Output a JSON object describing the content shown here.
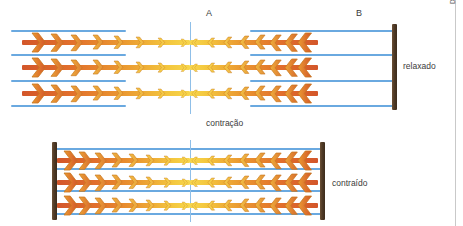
{
  "canvas": {
    "width": 463,
    "height": 226,
    "background": "#ffffff"
  },
  "credit": {
    "text": "Davidson França",
    "color": "#555555"
  },
  "labels": {
    "band_a": "A",
    "band_b": "B",
    "state_relaxed": "relaxado",
    "transition": "contração",
    "state_contracted": "contraído"
  },
  "colors": {
    "actin_blue": "#6aa9e0",
    "mline_blue": "#8fbfe8",
    "zdisc_brown": "#4f3a26",
    "myosin_orange": "#d3562a",
    "myosin_mid": "#eb9b31",
    "myosin_yellow": "#f7d64c",
    "edge_rule": "#c9c9c9",
    "text": "#3b3b3b"
  },
  "diagram": {
    "type": "sarcomere-sliding-filament",
    "panels": [
      {
        "id": "relaxed",
        "state_label": "relaxado",
        "y_top": 22,
        "mline_x": 190,
        "mline_y": 22,
        "mline_height": 92,
        "zdisc_right_x": 392,
        "zdisc_right_y": 24,
        "zdisc_right_height": 86,
        "zdisc_left_x": null,
        "actin_lines": [
          {
            "y": 30,
            "x1": 11,
            "x2": 126
          },
          {
            "y": 30,
            "x1": 250,
            "x2": 394
          },
          {
            "y": 54,
            "x1": 11,
            "x2": 126
          },
          {
            "y": 54,
            "x1": 250,
            "x2": 394
          },
          {
            "y": 80,
            "x1": 11,
            "x2": 126
          },
          {
            "y": 80,
            "x1": 250,
            "x2": 394
          },
          {
            "y": 105,
            "x1": 11,
            "x2": 126
          },
          {
            "y": 105,
            "x1": 250,
            "x2": 394
          }
        ],
        "myosin_rows": [
          {
            "y": 33,
            "left_x1": 22,
            "left_x2": 190,
            "right_x1": 190,
            "right_x2": 318
          },
          {
            "y": 58,
            "left_x1": 22,
            "left_x2": 190,
            "right_x1": 190,
            "right_x2": 318
          },
          {
            "y": 84,
            "left_x1": 22,
            "left_x2": 190,
            "right_x1": 190,
            "right_x2": 318
          }
        ]
      },
      {
        "id": "contracted",
        "state_label": "contraído",
        "y_top": 140,
        "mline_x": 190,
        "mline_y": 140,
        "mline_height": 82,
        "zdisc_left_x": 52,
        "zdisc_left_y": 142,
        "zdisc_left_height": 78,
        "zdisc_right_x": 320,
        "zdisc_right_y": 142,
        "zdisc_right_height": 78,
        "actin_lines": [
          {
            "y": 148,
            "x1": 56,
            "x2": 322
          },
          {
            "y": 168,
            "x1": 56,
            "x2": 322
          },
          {
            "y": 190,
            "x1": 56,
            "x2": 322
          },
          {
            "y": 213,
            "x1": 56,
            "x2": 322
          }
        ],
        "myosin_rows": [
          {
            "y": 151,
            "left_x1": 57,
            "left_x2": 190,
            "right_x1": 190,
            "right_x2": 318
          },
          {
            "y": 173,
            "left_x1": 57,
            "left_x2": 190,
            "right_x1": 190,
            "right_x2": 318
          },
          {
            "y": 196,
            "left_x1": 57,
            "left_x2": 190,
            "right_x1": 190,
            "right_x2": 318
          }
        ]
      }
    ],
    "band_label_positions": {
      "a_x": 206,
      "a_y": 8,
      "b_x": 356,
      "b_y": 8
    },
    "relaxed_label_position": {
      "x": 403,
      "y": 61
    },
    "contracao_label_position": {
      "x": 206,
      "y": 118
    },
    "contraido_label_position": {
      "x": 332,
      "y": 178
    },
    "edge_rule_x": 455,
    "credit_position": {
      "x": 449,
      "y": 4
    }
  }
}
